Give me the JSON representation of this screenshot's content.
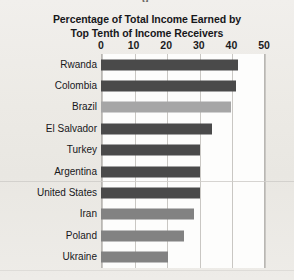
{
  "chart_data": {
    "type": "bar",
    "orientation": "horizontal",
    "title": "Percentage of Total Income Earned by Top Tenth of Income Receivers",
    "title_lines": [
      "Percentage of Total Income Earned by",
      "Top Tenth of Income Receivers"
    ],
    "xlabel": "",
    "ylabel": "",
    "xlim": [
      0,
      50
    ],
    "xticks": [
      0,
      10,
      20,
      30,
      40,
      50
    ],
    "xtick_labels": [
      "0",
      "10",
      "20",
      "30",
      "40",
      "50"
    ],
    "grid": "vertical",
    "legend": "none",
    "categories": [
      "Rwanda",
      "Colombia",
      "Brazil",
      "El Salvador",
      "Turkey",
      "Argentina",
      "United States",
      "Iran",
      "Poland",
      "Ukraine"
    ],
    "values": [
      42,
      41.5,
      40,
      34,
      30.5,
      30.5,
      30.5,
      28.5,
      25.5,
      20.5
    ],
    "bar_colors": [
      "#4a4a4a",
      "#4a4a4a",
      "#a6a6a6",
      "#4a4a4a",
      "#4a4a4a",
      "#4a4a4a",
      "#4a4a4a",
      "#828282",
      "#828282",
      "#828282"
    ]
  },
  "page": {
    "background_color": "#eceae6",
    "plot_background_color": "#fdfdfc",
    "gridline_color": "#c9c7c3",
    "top_cut_glyph": "g"
  }
}
